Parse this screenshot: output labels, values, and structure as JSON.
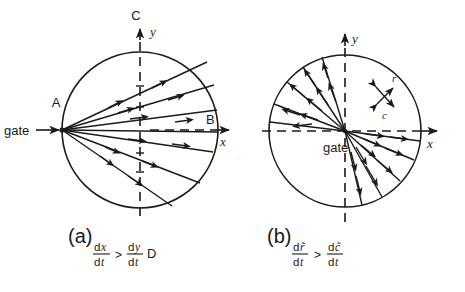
{
  "figure": {
    "type": "scientific-diagram",
    "background_color": "#ffffff",
    "ink_color": "#1a1a1a"
  },
  "panels": [
    {
      "id": "a",
      "tag": "(a)",
      "center": {
        "x": 140,
        "y": 130
      },
      "radius": 78,
      "source_label": "A",
      "source_position": "left-edge",
      "axis_labels": {
        "top_point": "C",
        "right_point": "B",
        "bottom_point": "D",
        "x_axis": "x",
        "y_axis": "y"
      },
      "annotation": {
        "text": "gate",
        "points_to": "A"
      },
      "inequality": {
        "left_numerator_d": "d",
        "left_numerator_var": "x",
        "left_denominator_d": "d",
        "left_denominator_var": "t",
        "operator": ">",
        "right_numerator_d": "d",
        "right_numerator_var": "y",
        "right_denominator_d": "d",
        "right_denominator_var": "t",
        "plain": "dx/dt > dy/dt"
      },
      "rays": {
        "origin": "left-edge-point-A",
        "count": 7,
        "angles_deg": [
          52,
          30,
          12,
          0,
          -12,
          -32,
          -54
        ],
        "note": "fan of arrows spreading rightward from A across the circle"
      }
    },
    {
      "id": "b",
      "tag": "(b)",
      "center": {
        "x": 345,
        "y": 131
      },
      "radius": 76,
      "source_label": "gate",
      "source_position": "center",
      "axis_labels": {
        "x_axis": "x",
        "y_axis": "y"
      },
      "legend": {
        "r_label": "r",
        "c_label": "c",
        "note": "crossed double-headed arrows inside upper-right quadrant"
      },
      "inequality": {
        "left_numerator_d": "d",
        "left_numerator_var": "r̃",
        "left_denominator_d": "d",
        "left_denominator_var": "t",
        "operator": ">",
        "right_numerator_d": "d",
        "right_numerator_var": "c̃",
        "right_denominator_d": "d",
        "right_denominator_var": "t",
        "plain": "dr̃/dt > dc̃/dt"
      },
      "rays": {
        "origin": "center",
        "count": 10,
        "angles_deg": [
          128,
          140,
          152,
          165,
          176,
          -8,
          -22,
          -38,
          -54,
          -70
        ],
        "note": "rays radiate into upper-left and lower-right quadrants only"
      }
    }
  ]
}
